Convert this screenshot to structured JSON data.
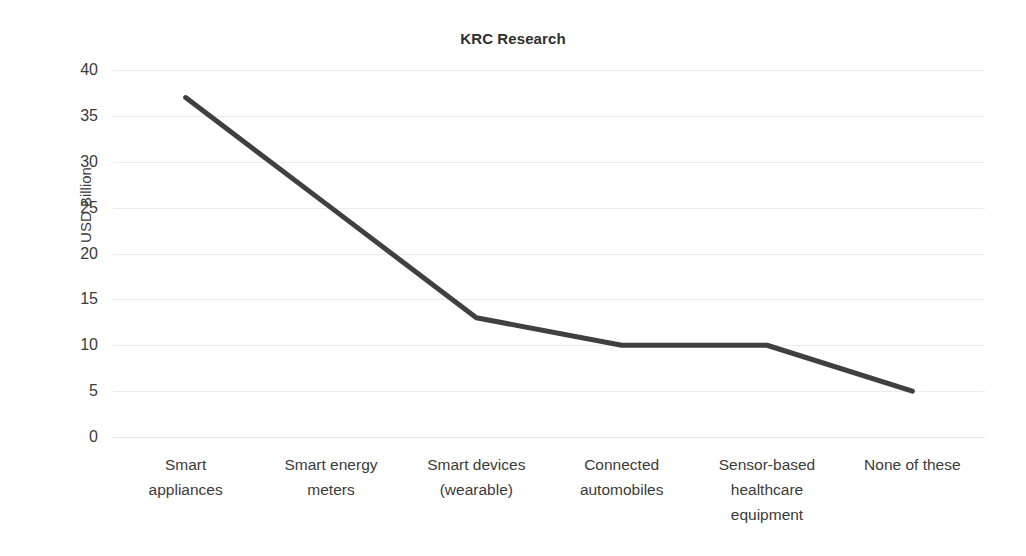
{
  "chart_data": {
    "type": "line",
    "title": "KRC Research",
    "xlabel": "",
    "ylabel": "USD Billion",
    "categories": [
      "Smart appliances",
      "Smart energy meters",
      "Smart devices (wearable)",
      "Connected automobiles",
      "Sensor-based healthcare equipment",
      "None of these"
    ],
    "category_lines": [
      [
        "Smart",
        "appliances"
      ],
      [
        "Smart energy",
        "meters"
      ],
      [
        "Smart devices",
        "(wearable)"
      ],
      [
        "Connected",
        "automobiles"
      ],
      [
        "Sensor-based",
        "healthcare",
        "equipment"
      ],
      [
        "None of these"
      ]
    ],
    "values": [
      37,
      25,
      13,
      10,
      10,
      5
    ],
    "ylim": [
      0,
      40
    ],
    "ytick_step": 5,
    "ytick_labels": [
      "40",
      "35",
      "30",
      "25",
      "20",
      "15",
      "10",
      "5",
      "0"
    ],
    "grid": true,
    "legend": false,
    "series_color": "#404040",
    "grid_color": "#e8ebf0",
    "text_color": "#3b3b3b",
    "line_width": 5
  }
}
